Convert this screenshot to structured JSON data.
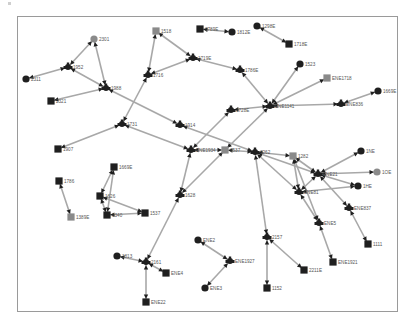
{
  "graph": {
    "title": "",
    "colors": {
      "node": "#1f1f1f",
      "highlight_node": "#8a8a8a",
      "edge": "#a8a8a8",
      "arrow": "#1f1f1f"
    },
    "nodes": [
      {
        "id": "2301",
        "label": "2301",
        "shape": "circle",
        "highlight": true
      },
      {
        "id": "1952",
        "label": "1952",
        "shape": "junction"
      },
      {
        "id": "2311",
        "label": "2311",
        "shape": "circle"
      },
      {
        "id": "1988",
        "label": "1988",
        "shape": "junction"
      },
      {
        "id": "2321",
        "label": "2321",
        "shape": "square"
      },
      {
        "id": "1731",
        "label": "1731",
        "shape": "junction"
      },
      {
        "id": "1907",
        "label": "1907",
        "shape": "square"
      },
      {
        "id": "1518",
        "label": "1518",
        "shape": "square",
        "highlight": true
      },
      {
        "id": "1716",
        "label": "1716",
        "shape": "junction"
      },
      {
        "id": "1719E",
        "label": "1719E",
        "shape": "junction"
      },
      {
        "id": "1789E",
        "label": "1789E",
        "shape": "square"
      },
      {
        "id": "1812E",
        "label": "1812E",
        "shape": "circle"
      },
      {
        "id": "1298E",
        "label": "1298E",
        "shape": "circle"
      },
      {
        "id": "1718E",
        "label": "1718E",
        "shape": "square"
      },
      {
        "id": "1786E",
        "label": "1786E",
        "shape": "junction"
      },
      {
        "id": "1523",
        "label": "1523",
        "shape": "circle"
      },
      {
        "id": "ENE1718",
        "label": "ENE1718",
        "shape": "square",
        "highlight": true
      },
      {
        "id": "ENE1141",
        "label": "ENE1141",
        "shape": "junction"
      },
      {
        "id": "1728E",
        "label": "1728E",
        "shape": "junction"
      },
      {
        "id": "ENE836",
        "label": "ENE836",
        "shape": "junction"
      },
      {
        "id": "1669E",
        "label": "1669E",
        "shape": "circle"
      },
      {
        "id": "1914",
        "label": "1914",
        "shape": "junction"
      },
      {
        "id": "ENE1934",
        "label": "ENE1934",
        "shape": "junction"
      },
      {
        "id": "1537",
        "label": "1537",
        "shape": "square",
        "highlight": true
      },
      {
        "id": "1669E2",
        "label": "1669E",
        "shape": "square"
      },
      {
        "id": "1786",
        "label": "1786",
        "shape": "square"
      },
      {
        "id": "1389E",
        "label": "1389E",
        "shape": "square",
        "highlight": true
      },
      {
        "id": "1626",
        "label": "1626",
        "shape": "square"
      },
      {
        "id": "1340",
        "label": "1340",
        "shape": "square"
      },
      {
        "id": "1537b",
        "label": "1537",
        "shape": "square"
      },
      {
        "id": "1628",
        "label": "1628",
        "shape": "junction"
      },
      {
        "id": "1262",
        "label": "1262",
        "shape": "junction"
      },
      {
        "id": "1282",
        "label": "1282",
        "shape": "square",
        "highlight": true
      },
      {
        "id": "ENE21",
        "label": "ENE21",
        "shape": "junction"
      },
      {
        "id": "1NE",
        "label": "1NE",
        "shape": "circle"
      },
      {
        "id": "1OE",
        "label": "1OE",
        "shape": "circle",
        "highlight": true
      },
      {
        "id": "1HE",
        "label": "1HE",
        "shape": "circle"
      },
      {
        "id": "ENE81",
        "label": "ENE81",
        "shape": "junction"
      },
      {
        "id": "ENE837",
        "label": "ENE837",
        "shape": "junction"
      },
      {
        "id": "ENE5",
        "label": "ENE5",
        "shape": "junction"
      },
      {
        "id": "1111",
        "label": "1111",
        "shape": "square"
      },
      {
        "id": "ENE1921",
        "label": "ENE1921",
        "shape": "square"
      },
      {
        "id": "2157",
        "label": "2157",
        "shape": "junction"
      },
      {
        "id": "2211E",
        "label": "2211E",
        "shape": "square"
      },
      {
        "id": "1152",
        "label": "1152",
        "shape": "square"
      },
      {
        "id": "ENE2",
        "label": "ENE2",
        "shape": "circle"
      },
      {
        "id": "ENE1927",
        "label": "ENE1927",
        "shape": "junction"
      },
      {
        "id": "ENE3",
        "label": "ENE3",
        "shape": "circle"
      },
      {
        "id": "1813",
        "label": "1813",
        "shape": "circle"
      },
      {
        "id": "2161",
        "label": "2161",
        "shape": "junction"
      },
      {
        "id": "ENE4",
        "label": "ENE4",
        "shape": "square"
      },
      {
        "id": "ENE22",
        "label": "ENE22",
        "shape": "square"
      }
    ],
    "edges": [
      [
        "2301",
        "1952"
      ],
      [
        "2301",
        "1988"
      ],
      [
        "2311",
        "1952"
      ],
      [
        "1952",
        "1988"
      ],
      [
        "2321",
        "1988"
      ],
      [
        "1988",
        "1914"
      ],
      [
        "1914",
        "1262"
      ],
      [
        "1731",
        "1907"
      ],
      [
        "1731",
        "ENE1934"
      ],
      [
        "1731",
        "1716"
      ],
      [
        "1716",
        "1518"
      ],
      [
        "1518",
        "1719E"
      ],
      [
        "1716",
        "1719E"
      ],
      [
        "1719E",
        "1786E"
      ],
      [
        "1789E",
        "1812E"
      ],
      [
        "1298E",
        "1718E"
      ],
      [
        "1786E",
        "ENE1141"
      ],
      [
        "1523",
        "ENE1141"
      ],
      [
        "ENE1718",
        "ENE1141"
      ],
      [
        "ENE1141",
        "1728E"
      ],
      [
        "ENE1141",
        "ENE836"
      ],
      [
        "ENE836",
        "1669E"
      ],
      [
        "1728E",
        "ENE1934"
      ],
      [
        "ENE1934",
        "1537"
      ],
      [
        "ENE1141",
        "1537"
      ],
      [
        "ENE1934",
        "1628"
      ],
      [
        "1537",
        "1628"
      ],
      [
        "1537",
        "1262"
      ],
      [
        "1262",
        "1282"
      ],
      [
        "1262",
        "ENE21"
      ],
      [
        "1262",
        "ENE81"
      ],
      [
        "1282",
        "ENE21"
      ],
      [
        "1282",
        "ENE81"
      ],
      [
        "1282",
        "ENE5"
      ],
      [
        "ENE21",
        "1NE"
      ],
      [
        "ENE21",
        "1OE"
      ],
      [
        "ENE21",
        "1HE"
      ],
      [
        "ENE21",
        "ENE837"
      ],
      [
        "ENE21",
        "ENE81"
      ],
      [
        "ENE837",
        "1111"
      ],
      [
        "ENE81",
        "ENE5"
      ],
      [
        "ENE5",
        "ENE1921"
      ],
      [
        "ENE81",
        "1HE"
      ],
      [
        "1262",
        "2157"
      ],
      [
        "2157",
        "2211E"
      ],
      [
        "2157",
        "1152"
      ],
      [
        "ENE2",
        "ENE1927"
      ],
      [
        "ENE1927",
        "ENE3"
      ],
      [
        "1628",
        "2161"
      ],
      [
        "1813",
        "2161"
      ],
      [
        "2161",
        "ENE4"
      ],
      [
        "2161",
        "ENE22"
      ],
      [
        "1669E2",
        "1626"
      ],
      [
        "1669E2",
        "1340"
      ],
      [
        "1626",
        "1340"
      ],
      [
        "1626",
        "1537b"
      ],
      [
        "1340",
        "1537b"
      ],
      [
        "1786",
        "1389E"
      ]
    ]
  }
}
